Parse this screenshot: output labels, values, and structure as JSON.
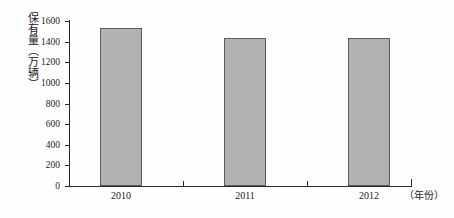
{
  "chart_data": {
    "type": "bar",
    "title": "",
    "subtitle": "",
    "xlabel": "（年份）",
    "ylabel": "保有量（万辆）",
    "categories": [
      "2010",
      "2011",
      "2012"
    ],
    "values": [
      1530,
      1440,
      1440
    ],
    "series": [
      {
        "name": "保有量",
        "values": [
          1530,
          1440,
          1440
        ]
      }
    ],
    "ylim": [
      0,
      1600
    ],
    "ytick_labels": [
      "0",
      "200",
      "400",
      "600",
      "800",
      "1000",
      "1200",
      "1400",
      "1600"
    ],
    "ytick_values": [
      0,
      200,
      400,
      600,
      800,
      1000,
      1200,
      1400,
      1600
    ],
    "grid": false,
    "legend": false,
    "legend_position": "none",
    "bar_fill_color": "#b1b1b1",
    "bar_border_color": "#5d5d5d",
    "axis_color": "#2a2a2a",
    "background_color": "#fefefe"
  }
}
